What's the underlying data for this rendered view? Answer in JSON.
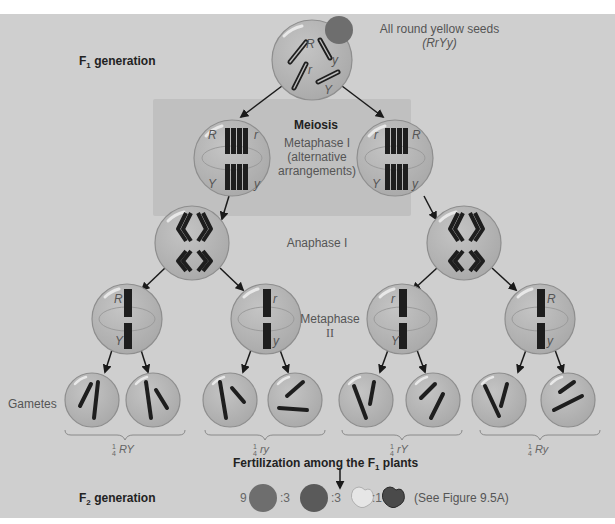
{
  "labels": {
    "f1_generation": "F",
    "f1_sub": "1",
    "f1_suffix": " generation",
    "parent_desc_line1": "All round yellow seeds",
    "parent_desc_line2": "(RrYy)",
    "meiosis": "Meiosis",
    "metaphase1_line1": "Metaphase I",
    "metaphase1_line2": "(alternative",
    "metaphase1_line3": "arrangements)",
    "anaphase1": "Anaphase I",
    "metaphase2_line1": "Metaphase",
    "metaphase2_line2": "II",
    "gametes": "Gametes",
    "fertilization_prefix": "Fertilization among the F",
    "fertilization_sub": "1",
    "fertilization_suffix": " plants",
    "f2_prefix": "F",
    "f2_sub": "2",
    "f2_suffix": " generation",
    "see_figure": "(See Figure 9.5A)"
  },
  "gamete_groups": [
    {
      "fraction_num": "1",
      "fraction_den": "4",
      "genotype": "RY"
    },
    {
      "fraction_num": "1",
      "fraction_den": "4",
      "genotype": "ry"
    },
    {
      "fraction_num": "1",
      "fraction_den": "4",
      "genotype": "rY"
    },
    {
      "fraction_num": "1",
      "fraction_den": "4",
      "genotype": "Ry"
    }
  ],
  "f2_ratio": [
    {
      "count": "9",
      "phenotype": "round yellow",
      "icon": "round-yellow-seed-icon"
    },
    {
      "count": ":3",
      "phenotype": "round green",
      "icon": "round-green-seed-icon"
    },
    {
      "count": ":3",
      "phenotype": "wrinkled yellow",
      "icon": "wrinkled-yellow-seed-icon"
    },
    {
      "count": ":1",
      "phenotype": "wrinkled green",
      "icon": "wrinkled-green-seed-icon"
    }
  ],
  "alleles": {
    "metaphase1_left": {
      "top_left": "R",
      "top_right": "r",
      "bottom_left": "Y",
      "bottom_right": "y"
    },
    "metaphase1_right": {
      "top_left": "r",
      "top_right": "R",
      "bottom_left": "Y",
      "bottom_right": "y"
    },
    "parent": [
      "R",
      "r",
      "y",
      "Y"
    ],
    "metaphase2": [
      {
        "top": "R",
        "bottom": "Y"
      },
      {
        "top": "r",
        "bottom": "y"
      },
      {
        "top": "r",
        "bottom": "Y"
      },
      {
        "top": "R",
        "bottom": "y"
      }
    ],
    "gametes": [
      [
        "Y",
        "R"
      ],
      [
        "R",
        "Y"
      ],
      [
        "r",
        "y"
      ],
      [
        "y",
        "r"
      ],
      [
        "r",
        "Y"
      ],
      [
        "Y",
        "r"
      ],
      [
        "R",
        "y"
      ],
      [
        "y",
        "R"
      ]
    ]
  },
  "colors": {
    "panel_bg": "#cfcfcf",
    "meiosis_box": "#c0c0c0",
    "cell_fill": "#b4b4b4",
    "cell_stroke": "#8e8e8e",
    "chromosome": "#1e1e1e",
    "seed_dark": "#6e6e6e",
    "seed_light": "#e6e6e6"
  }
}
